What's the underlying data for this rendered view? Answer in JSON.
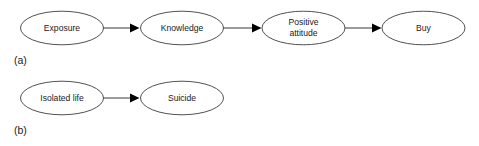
{
  "figure": {
    "background_color": "#ffffff",
    "node_fill": "#ffffff",
    "node_stroke": "#3d3d3d",
    "edge_color": "#4a4a4a",
    "arrowhead_color": "#000000",
    "text_color": "#1a1a1a"
  },
  "panels": [
    {
      "caption": "(a)",
      "nodes": [
        {
          "id": "exposure",
          "label": "Exposure",
          "lines": [
            "Exposure"
          ]
        },
        {
          "id": "knowledge",
          "label": "Knowledge",
          "lines": [
            "Knowledge"
          ]
        },
        {
          "id": "positive-attitude",
          "label": "Positive attitude",
          "lines": [
            "Positive",
            "attitude"
          ]
        },
        {
          "id": "buy",
          "label": "Buy",
          "lines": [
            "Buy"
          ]
        }
      ],
      "edges": [
        {
          "from": "exposure",
          "to": "knowledge"
        },
        {
          "from": "knowledge",
          "to": "positive-attitude"
        },
        {
          "from": "positive-attitude",
          "to": "buy"
        }
      ]
    },
    {
      "caption": "(b)",
      "nodes": [
        {
          "id": "isolated-life",
          "label": "Isolated life",
          "lines": [
            "Isolated life"
          ]
        },
        {
          "id": "suicide",
          "label": "Suicide",
          "lines": [
            "Suicide"
          ]
        }
      ],
      "edges": [
        {
          "from": "isolated-life",
          "to": "suicide"
        }
      ]
    }
  ]
}
